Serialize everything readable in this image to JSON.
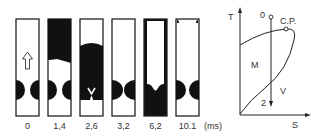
{
  "figure": {
    "tubes": [
      {
        "time": "0",
        "state": "initial"
      },
      {
        "time": "1,4",
        "state": "upper-dark"
      },
      {
        "time": "2,6",
        "state": "mostly-dark"
      },
      {
        "time": "3,2",
        "state": "clear"
      },
      {
        "time": "6,2",
        "state": "lower-dark"
      },
      {
        "time": "10.1",
        "state": "clear"
      }
    ],
    "time_unit": "(ms)",
    "diagram": {
      "y_axis": "T",
      "x_axis": "S",
      "start_point": "0",
      "end_point": "2",
      "critical_point": "C.P.",
      "region_mixed": "M",
      "region_vapor": "V"
    }
  }
}
